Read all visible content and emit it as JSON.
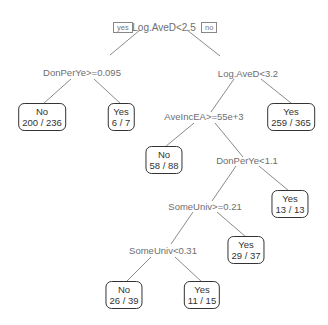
{
  "edge_labels": {
    "yes": "yes",
    "no": "no"
  },
  "splits": {
    "n1": "Log.AveD<2.5",
    "n2": "DonPerYe>=0.095",
    "n3": "Log.AveD<3.2",
    "n4": "AveIncEA>=55e+3",
    "n5": "DonPerYe<1.1",
    "n6": "SomeUniv>=0.21",
    "n7": "SomeUniv<0.31"
  },
  "leaves": {
    "l1": {
      "class": "No",
      "count": "200 / 236"
    },
    "l2": {
      "class": "Yes",
      "count": "6 / 7"
    },
    "l3": {
      "class": "Yes",
      "count": "259 / 365"
    },
    "l4": {
      "class": "No",
      "count": "58 / 88"
    },
    "l5": {
      "class": "Yes",
      "count": "13 / 13"
    },
    "l6": {
      "class": "Yes",
      "count": "29 / 37"
    },
    "l7": {
      "class": "No",
      "count": "26 / 39"
    },
    "l8": {
      "class": "Yes",
      "count": "11 / 15"
    }
  }
}
